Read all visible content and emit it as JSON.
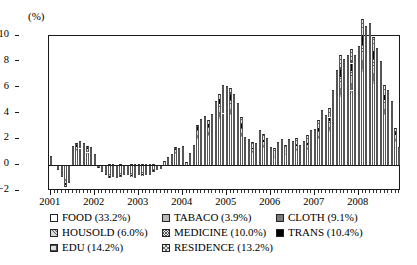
{
  "axis": {
    "unit_label": "(%)",
    "y_ticks": [
      10,
      8,
      6,
      4,
      2,
      0,
      -2
    ],
    "y_tick_labels": [
      "10",
      "8",
      "6",
      "4",
      "2",
      "0",
      "−2"
    ],
    "x_tick_labels": [
      "2001",
      "2002",
      "2003",
      "2004",
      "2005",
      "2006",
      "2007",
      "2008"
    ]
  },
  "legend": {
    "items": [
      {
        "label": "FOOD (33.2%)",
        "key": "food",
        "swatch": "white-empty"
      },
      {
        "label": "TABACO (3.9%)",
        "key": "tabaco",
        "swatch": "light-gray-solid"
      },
      {
        "label": "CLOTH (9.1%)",
        "key": "cloth",
        "swatch": "dark-gray-solid"
      },
      {
        "label": "HOUSOLD (6.0%)",
        "key": "housold",
        "swatch": "diagonal-hatch"
      },
      {
        "label": "MEDICINE (10.0%)",
        "key": "medicine",
        "swatch": "cross-hatch-fine"
      },
      {
        "label": "TRANS (10.4%)",
        "key": "trans",
        "swatch": "black-solid"
      },
      {
        "label": "EDU (14.2%)",
        "key": "edu",
        "swatch": "grid-hatch"
      },
      {
        "label": "RESIDENCE (13.2%)",
        "key": "residence",
        "swatch": "cross-hatch-coarse"
      }
    ]
  },
  "chart_data": {
    "type": "bar",
    "stacked": true,
    "title": "",
    "subtitle": "",
    "xlabel": "",
    "ylabel": "(%)",
    "ylim": [
      -2,
      10
    ],
    "ygrid": false,
    "legend_position": "below",
    "x_axis_type": "monthly",
    "x_start": "2001-01",
    "x_end": "2008-12",
    "n_points": 96,
    "categories": [
      "2001-01",
      "2001-02",
      "2001-03",
      "2001-04",
      "2001-05",
      "2001-06",
      "2001-07",
      "2001-08",
      "2001-09",
      "2001-10",
      "2001-11",
      "2001-12",
      "2002-01",
      "2002-02",
      "2002-03",
      "2002-04",
      "2002-05",
      "2002-06",
      "2002-07",
      "2002-08",
      "2002-09",
      "2002-10",
      "2002-11",
      "2002-12",
      "2003-01",
      "2003-02",
      "2003-03",
      "2003-04",
      "2003-05",
      "2003-06",
      "2003-07",
      "2003-08",
      "2003-09",
      "2003-10",
      "2003-11",
      "2003-12",
      "2004-01",
      "2004-02",
      "2004-03",
      "2004-04",
      "2004-05",
      "2004-06",
      "2004-07",
      "2004-08",
      "2004-09",
      "2004-10",
      "2004-11",
      "2004-12",
      "2005-01",
      "2005-02",
      "2005-03",
      "2005-04",
      "2005-05",
      "2005-06",
      "2005-07",
      "2005-08",
      "2005-09",
      "2005-10",
      "2005-11",
      "2005-12",
      "2006-01",
      "2006-02",
      "2006-03",
      "2006-04",
      "2006-05",
      "2006-06",
      "2006-07",
      "2006-08",
      "2006-09",
      "2006-10",
      "2006-11",
      "2006-12",
      "2007-01",
      "2007-02",
      "2007-03",
      "2007-04",
      "2007-05",
      "2007-06",
      "2007-07",
      "2007-08",
      "2007-09",
      "2007-10",
      "2007-11",
      "2007-12",
      "2008-01",
      "2008-02",
      "2008-03",
      "2008-04",
      "2008-05",
      "2008-06",
      "2008-07",
      "2008-08",
      "2008-09",
      "2008-10",
      "2008-11",
      "2008-12"
    ],
    "totals": [
      0.7,
      0.0,
      -0.3,
      -0.8,
      -1.5,
      -1.2,
      1.3,
      1.5,
      1.7,
      1.5,
      1.3,
      1.2,
      0.8,
      -0.1,
      -0.4,
      -0.6,
      -0.9,
      -0.8,
      -0.9,
      -0.8,
      -0.7,
      -0.7,
      -0.8,
      -0.9,
      -0.6,
      -0.7,
      -0.6,
      -0.6,
      -0.4,
      -0.3,
      -0.2,
      0.3,
      0.6,
      0.8,
      1.2,
      1.1,
      1.3,
      0.2,
      0.8,
      1.4,
      2.7,
      3.1,
      3.3,
      3.0,
      3.5,
      4.3,
      4.7,
      5.2,
      5.1,
      5.0,
      4.6,
      3.9,
      3.0,
      1.8,
      1.6,
      1.4,
      1.3,
      2.2,
      1.9,
      1.6,
      1.0,
      0.9,
      1.3,
      1.5,
      1.2,
      1.5,
      1.4,
      1.6,
      1.2,
      1.4,
      1.7,
      2.0,
      2.2,
      2.7,
      3.3,
      3.0,
      3.4,
      4.4,
      5.6,
      6.5,
      6.2,
      6.5,
      6.9,
      6.5,
      7.1,
      8.7,
      8.3,
      8.5,
      7.7,
      7.1,
      6.3,
      4.9,
      4.6,
      4.0,
      2.4,
      1.2
    ],
    "series": [
      {
        "name": "FOOD",
        "share": 33.2,
        "values": [
          0.45,
          0.0,
          -0.2,
          -0.55,
          -1.05,
          -0.85,
          0.95,
          1.1,
          1.25,
          1.1,
          0.95,
          0.85,
          0.55,
          -0.1,
          -0.3,
          -0.45,
          -0.65,
          -0.6,
          -0.65,
          -0.6,
          -0.5,
          -0.5,
          -0.6,
          -0.65,
          -0.45,
          -0.5,
          -0.45,
          -0.45,
          -0.3,
          -0.22,
          -0.15,
          0.22,
          0.42,
          0.58,
          0.9,
          0.82,
          0.95,
          0.15,
          0.58,
          1.02,
          2.05,
          2.35,
          2.5,
          2.25,
          2.65,
          3.3,
          3.6,
          4.0,
          3.95,
          3.85,
          3.5,
          2.95,
          2.2,
          1.25,
          1.1,
          0.95,
          0.9,
          1.6,
          1.35,
          1.1,
          0.65,
          0.6,
          0.9,
          1.05,
          0.8,
          1.05,
          0.95,
          1.1,
          0.8,
          0.95,
          1.2,
          1.45,
          1.6,
          2.0,
          2.5,
          2.25,
          2.6,
          3.45,
          4.45,
          5.25,
          5.0,
          5.25,
          5.6,
          5.25,
          5.8,
          7.2,
          6.85,
          7.0,
          6.3,
          5.75,
          5.05,
          3.85,
          3.6,
          3.1,
          1.8,
          0.85
        ]
      },
      {
        "name": "TABACO",
        "share": 3.9,
        "values": [
          0.02,
          0.0,
          -0.01,
          -0.02,
          -0.04,
          -0.03,
          0.04,
          0.04,
          0.04,
          0.04,
          0.03,
          0.03,
          0.02,
          0.0,
          -0.01,
          -0.01,
          -0.02,
          -0.02,
          -0.02,
          -0.02,
          -0.02,
          -0.02,
          -0.02,
          -0.02,
          -0.02,
          -0.02,
          -0.02,
          -0.02,
          -0.01,
          -0.01,
          -0.01,
          0.01,
          0.02,
          0.02,
          0.03,
          0.03,
          0.04,
          0.01,
          0.02,
          0.04,
          0.07,
          0.08,
          0.08,
          0.08,
          0.09,
          0.11,
          0.12,
          0.13,
          0.13,
          0.12,
          0.11,
          0.1,
          0.07,
          0.05,
          0.04,
          0.04,
          0.03,
          0.06,
          0.05,
          0.04,
          0.03,
          0.02,
          0.03,
          0.04,
          0.03,
          0.04,
          0.04,
          0.04,
          0.03,
          0.04,
          0.04,
          0.05,
          0.06,
          0.07,
          0.08,
          0.08,
          0.09,
          0.11,
          0.14,
          0.17,
          0.16,
          0.17,
          0.18,
          0.17,
          0.18,
          0.23,
          0.22,
          0.22,
          0.2,
          0.18,
          0.16,
          0.12,
          0.12,
          0.1,
          0.06,
          0.03
        ]
      },
      {
        "name": "CLOTH",
        "share": 9.1,
        "values": [
          0.05,
          0.0,
          -0.02,
          -0.06,
          -0.11,
          -0.09,
          0.1,
          0.11,
          0.13,
          0.11,
          0.1,
          0.09,
          0.06,
          -0.01,
          -0.03,
          -0.05,
          -0.07,
          -0.06,
          -0.07,
          -0.06,
          -0.05,
          -0.05,
          -0.06,
          -0.07,
          -0.05,
          -0.05,
          -0.05,
          -0.05,
          -0.03,
          -0.02,
          -0.02,
          0.02,
          0.04,
          0.06,
          0.09,
          0.08,
          0.1,
          0.02,
          0.06,
          0.1,
          0.21,
          0.24,
          0.25,
          0.23,
          0.27,
          0.33,
          0.36,
          0.4,
          0.4,
          0.39,
          0.35,
          0.3,
          0.22,
          0.13,
          0.11,
          0.1,
          0.09,
          0.16,
          0.14,
          0.11,
          0.07,
          0.06,
          0.09,
          0.11,
          0.08,
          0.11,
          0.1,
          0.11,
          0.08,
          0.1,
          0.12,
          0.15,
          0.16,
          0.2,
          0.25,
          0.23,
          0.26,
          0.35,
          0.45,
          0.53,
          0.5,
          0.53,
          0.56,
          0.53,
          0.58,
          0.72,
          0.69,
          0.7,
          0.63,
          0.58,
          0.51,
          0.39,
          0.36,
          0.31,
          0.18,
          0.09
        ]
      },
      {
        "name": "HOUSOLD",
        "share": 6.0,
        "values": [
          0.03,
          0.0,
          -0.01,
          -0.04,
          -0.07,
          -0.06,
          0.07,
          0.07,
          0.08,
          0.07,
          0.06,
          0.06,
          0.04,
          -0.01,
          -0.02,
          -0.03,
          -0.05,
          -0.04,
          -0.05,
          -0.04,
          -0.03,
          -0.03,
          -0.04,
          -0.05,
          -0.03,
          -0.04,
          -0.03,
          -0.03,
          -0.02,
          -0.01,
          -0.01,
          0.01,
          0.03,
          0.04,
          0.06,
          0.05,
          0.07,
          0.01,
          0.04,
          0.07,
          0.14,
          0.16,
          0.17,
          0.15,
          0.18,
          0.22,
          0.24,
          0.26,
          0.26,
          0.25,
          0.23,
          0.2,
          0.15,
          0.09,
          0.08,
          0.07,
          0.06,
          0.11,
          0.09,
          0.08,
          0.05,
          0.04,
          0.06,
          0.07,
          0.06,
          0.07,
          0.07,
          0.08,
          0.06,
          0.07,
          0.08,
          0.1,
          0.11,
          0.13,
          0.16,
          0.15,
          0.17,
          0.22,
          0.29,
          0.34,
          0.32,
          0.34,
          0.37,
          0.34,
          0.38,
          0.47,
          0.45,
          0.46,
          0.42,
          0.38,
          0.34,
          0.26,
          0.24,
          0.21,
          0.12,
          0.06
        ]
      },
      {
        "name": "MEDICINE",
        "share": 10.0,
        "values": [
          0.05,
          0.0,
          -0.02,
          -0.06,
          -0.12,
          -0.09,
          0.11,
          0.12,
          0.14,
          0.12,
          0.11,
          0.1,
          0.06,
          -0.01,
          -0.03,
          -0.05,
          -0.07,
          -0.07,
          -0.07,
          -0.07,
          -0.06,
          -0.06,
          -0.07,
          -0.07,
          -0.05,
          -0.06,
          -0.05,
          -0.05,
          -0.04,
          -0.03,
          -0.02,
          0.02,
          0.05,
          0.06,
          0.1,
          0.09,
          0.11,
          0.02,
          0.07,
          0.11,
          0.22,
          0.26,
          0.27,
          0.25,
          0.29,
          0.36,
          0.39,
          0.43,
          0.42,
          0.41,
          0.38,
          0.32,
          0.25,
          0.15,
          0.13,
          0.11,
          0.1,
          0.18,
          0.16,
          0.13,
          0.08,
          0.07,
          0.11,
          0.12,
          0.1,
          0.12,
          0.11,
          0.13,
          0.1,
          0.11,
          0.14,
          0.16,
          0.18,
          0.22,
          0.27,
          0.25,
          0.28,
          0.37,
          0.46,
          0.54,
          0.51,
          0.54,
          0.57,
          0.54,
          0.59,
          0.72,
          0.69,
          0.71,
          0.64,
          0.59,
          0.52,
          0.4,
          0.38,
          0.33,
          0.2,
          0.1
        ]
      },
      {
        "name": "TRANS",
        "share": 10.4,
        "values": [
          0.05,
          0.0,
          -0.02,
          -0.06,
          -0.12,
          -0.1,
          0.11,
          0.12,
          0.14,
          0.13,
          0.11,
          0.1,
          0.07,
          -0.01,
          -0.03,
          -0.05,
          -0.08,
          -0.07,
          -0.08,
          -0.07,
          -0.06,
          -0.06,
          -0.07,
          -0.08,
          -0.05,
          -0.06,
          -0.05,
          -0.05,
          -0.04,
          -0.03,
          -0.02,
          0.03,
          0.05,
          0.07,
          0.1,
          0.09,
          0.11,
          0.02,
          0.07,
          0.12,
          0.23,
          0.27,
          0.28,
          0.26,
          0.3,
          0.37,
          0.4,
          0.45,
          0.44,
          0.43,
          0.39,
          0.34,
          0.26,
          0.15,
          0.14,
          0.12,
          0.11,
          0.19,
          0.16,
          0.14,
          0.09,
          0.08,
          0.11,
          0.13,
          0.1,
          0.13,
          0.12,
          0.13,
          0.1,
          0.12,
          0.14,
          0.17,
          0.19,
          0.23,
          0.28,
          0.26,
          0.29,
          0.38,
          0.48,
          0.56,
          0.53,
          0.56,
          0.59,
          0.56,
          0.61,
          0.75,
          0.72,
          0.73,
          0.66,
          0.61,
          0.54,
          0.42,
          0.39,
          0.34,
          0.21,
          0.1
        ]
      },
      {
        "name": "EDU",
        "share": 14.2,
        "values": [
          0.03,
          0.0,
          -0.01,
          -0.03,
          -0.05,
          -0.04,
          0.05,
          0.06,
          0.06,
          0.06,
          0.05,
          0.05,
          0.03,
          0.0,
          -0.01,
          -0.02,
          -0.03,
          -0.03,
          -0.03,
          -0.03,
          -0.03,
          -0.03,
          -0.03,
          -0.03,
          -0.02,
          -0.03,
          -0.02,
          -0.02,
          -0.02,
          -0.01,
          -0.01,
          0.01,
          0.02,
          0.03,
          0.04,
          0.04,
          0.05,
          0.01,
          0.03,
          0.05,
          0.1,
          0.12,
          0.12,
          0.11,
          0.13,
          0.16,
          0.17,
          0.19,
          0.19,
          0.18,
          0.17,
          0.14,
          0.11,
          0.07,
          0.06,
          0.05,
          0.05,
          0.08,
          0.07,
          0.06,
          0.04,
          0.03,
          0.05,
          0.05,
          0.04,
          0.05,
          0.05,
          0.06,
          0.04,
          0.05,
          0.06,
          0.07,
          0.08,
          0.1,
          0.12,
          0.11,
          0.13,
          0.16,
          0.21,
          0.24,
          0.23,
          0.24,
          0.26,
          0.24,
          0.26,
          0.33,
          0.31,
          0.32,
          0.29,
          0.26,
          0.23,
          0.18,
          0.17,
          0.15,
          0.09,
          0.04
        ]
      },
      {
        "name": "RESIDENCE",
        "share": 13.2,
        "values": [
          0.02,
          0.0,
          -0.01,
          -0.03,
          -0.04,
          -0.04,
          0.07,
          0.08,
          0.06,
          0.07,
          0.09,
          0.12,
          0.05,
          0.04,
          -0.01,
          -0.04,
          0.07,
          0.09,
          0.05,
          0.08,
          0.05,
          0.05,
          0.06,
          0.07,
          0.07,
          0.06,
          0.07,
          0.07,
          0.06,
          0.03,
          0.04,
          0.01,
          0.03,
          0.04,
          0.08,
          0.1,
          0.07,
          0.04,
          0.11,
          0.09,
          0.08,
          0.12,
          0.13,
          0.17,
          0.09,
          0.15,
          0.22,
          0.34,
          0.31,
          0.37,
          0.37,
          0.45,
          0.44,
          0.31,
          0.34,
          0.36,
          0.36,
          0.32,
          0.38,
          0.44,
          0.39,
          0.4,
          0.45,
          0.43,
          0.39,
          0.43,
          0.46,
          0.45,
          0.39,
          0.46,
          0.52,
          0.56,
          0.42,
          0.55,
          0.64,
          0.57,
          0.58,
          0.75,
          0.92,
          0.87,
          0.95,
          0.87,
          0.87,
          0.87,
          0.8,
          0.88,
          0.87,
          0.86,
          0.76,
          0.75,
          0.75,
          0.58,
          0.54,
          0.46,
          0.24,
          0.13
        ]
      }
    ]
  }
}
